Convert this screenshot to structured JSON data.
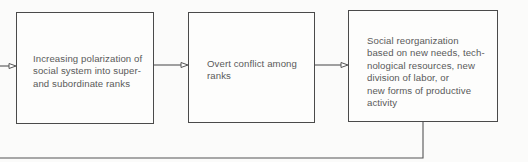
{
  "diagram": {
    "type": "flowchart",
    "direction": "left-to-right with feedback loop",
    "nodes": [
      {
        "id": "polarization",
        "label": "Increasing polarization of\nsocial system into super-\nand subordinate ranks"
      },
      {
        "id": "conflict",
        "label": "Overt conflict among\nranks"
      },
      {
        "id": "reorganization",
        "label": "Social reorganization\nbased on new needs, tech-\nnological resources, new\ndivision of labor, or\nnew forms of productive\nactivity"
      }
    ],
    "edges": [
      {
        "from": "reorganization",
        "to": "polarization",
        "kind": "feedback"
      },
      {
        "from": "polarization",
        "to": "conflict"
      },
      {
        "from": "conflict",
        "to": "reorganization"
      }
    ],
    "colors": {
      "stroke": "#4a4a4a",
      "text": "#5a5a5a",
      "background": "#fbfbfa"
    }
  }
}
